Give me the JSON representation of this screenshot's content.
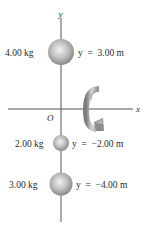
{
  "diagram": {
    "type": "rotating point masses on y-axis",
    "axes": {
      "x_label": "x",
      "y_label": "y",
      "origin_label": "O"
    },
    "rotation_arrow": {
      "icon": "curved-rotation-arrow-icon",
      "description": "rotation about the x-axis",
      "color": "#8a8a8a"
    },
    "masses": [
      {
        "mass_label": "4.00 kg",
        "position_label": "y  =  3.00 m",
        "mass": 4.0,
        "y": 3.0
      },
      {
        "mass_label": "2.00 kg",
        "position_label": "y  =  −2.00 m",
        "mass": 2.0,
        "y": -2.0
      },
      {
        "mass_label": "3.00 kg",
        "position_label": "y  =  −4.00 m",
        "mass": 3.0,
        "y": -4.0
      }
    ],
    "colors": {
      "sphere_light": "#e6e6e6",
      "sphere_dark": "#8c8c8c",
      "axis": "#555555",
      "arrow_light": "#d0d0d0",
      "arrow_dark": "#7a7a7a"
    }
  }
}
